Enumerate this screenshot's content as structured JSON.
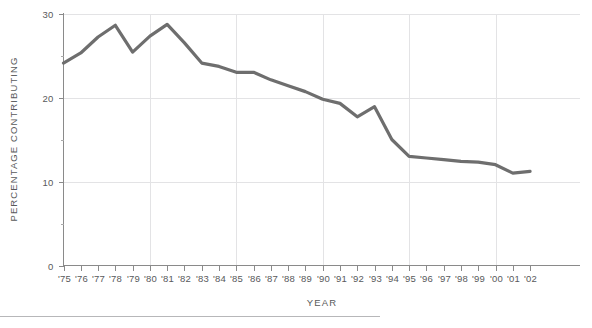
{
  "chart_data": {
    "type": "line",
    "title": "",
    "xlabel": "YEAR",
    "ylabel": "PERCENTAGE CONTRIBUTING",
    "categories": [
      "'75",
      "'76",
      "'77",
      "'78",
      "'79",
      "'80",
      "'81",
      "'82",
      "'83",
      "'84",
      "'85",
      "'86",
      "'87",
      "'88",
      "'89",
      "'90",
      "'91",
      "'92",
      "'93",
      "'94",
      "'95",
      "'96",
      "'97",
      "'98",
      "'99",
      "'00",
      "'01",
      "'02"
    ],
    "values": [
      24.1,
      25.3,
      27.2,
      28.6,
      25.4,
      27.3,
      28.7,
      26.5,
      24.1,
      23.7,
      23.0,
      23.0,
      22.1,
      21.4,
      20.7,
      19.8,
      19.3,
      17.7,
      18.9,
      15.0,
      13.0,
      12.8,
      12.6,
      12.4,
      12.3,
      12.0,
      11.0,
      11.2
    ],
    "ylim": [
      0,
      30
    ],
    "yticks": [
      0,
      10,
      20,
      30
    ],
    "ytick_labels": [
      "0",
      "10",
      "20",
      "30"
    ],
    "yminor_ticks": [
      5,
      15,
      25
    ],
    "xgrid_years": [
      "'80",
      "'85",
      "'90",
      "'95",
      "'00"
    ],
    "grid": true,
    "legend": "none",
    "series_color": "#6e6e6e",
    "grid_color": "#e3e3e5",
    "axis_color": "#8a8a8a",
    "text_color": "#58595b"
  }
}
